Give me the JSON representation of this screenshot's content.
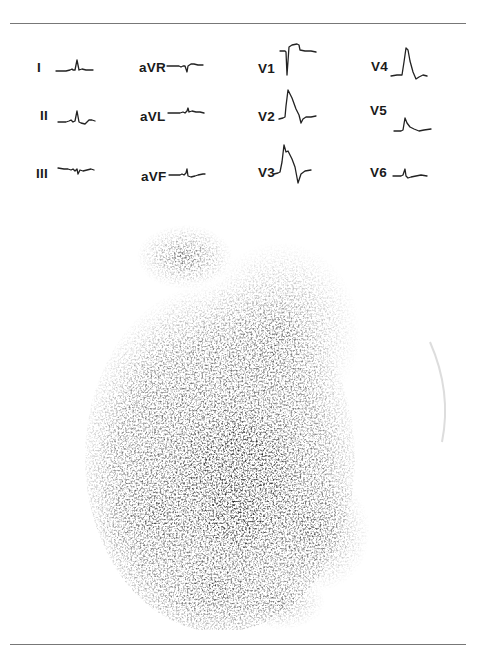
{
  "figure": {
    "type": "12-lead ECG with cardiac scintigram",
    "rules": [
      "top",
      "bottom"
    ]
  },
  "ecg": {
    "leads": [
      {
        "id": "I",
        "label": "I",
        "col": 0,
        "row": 0
      },
      {
        "id": "II",
        "label": "II",
        "col": 0,
        "row": 1
      },
      {
        "id": "III",
        "label": "III",
        "col": 0,
        "row": 2
      },
      {
        "id": "aVR",
        "label": "aVR",
        "col": 1,
        "row": 0
      },
      {
        "id": "aVL",
        "label": "aVL",
        "col": 1,
        "row": 1
      },
      {
        "id": "aVF",
        "label": "aVF",
        "col": 1,
        "row": 2
      },
      {
        "id": "V1",
        "label": "V1",
        "col": 2,
        "row": 0
      },
      {
        "id": "V2",
        "label": "V2",
        "col": 2,
        "row": 1
      },
      {
        "id": "V3",
        "label": "V3",
        "col": 2,
        "row": 2
      },
      {
        "id": "V4",
        "label": "V4",
        "col": 3,
        "row": 0
      },
      {
        "id": "V5",
        "label": "V5",
        "col": 3,
        "row": 1
      },
      {
        "id": "V6",
        "label": "V6",
        "col": 3,
        "row": 2
      }
    ]
  },
  "scintigram": {
    "description": "Planar nuclear scan with dense central uptake focus and heterogeneous speckled activity",
    "ink_color": "#2a2a2a"
  }
}
